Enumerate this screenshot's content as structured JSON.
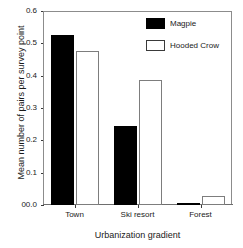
{
  "chart_data": {
    "type": "bar",
    "title": "",
    "xlabel": "Urbanization gradient",
    "ylabel": "Mean number of pairs per survey point",
    "categories": [
      "Town",
      "Ski resort",
      "Forest"
    ],
    "series": [
      {
        "name": "Magpie",
        "values": [
          0.525,
          0.245,
          0.005
        ],
        "color": "#000000",
        "style": "filled"
      },
      {
        "name": "Hooded Crow",
        "values": [
          0.475,
          0.388,
          0.028
        ],
        "color": "#ffffff",
        "style": "hollow"
      }
    ],
    "ylim": [
      0.0,
      0.6
    ],
    "yticks": [
      0.0,
      0.1,
      0.2,
      0.3,
      0.4,
      0.5,
      0.6
    ],
    "ytick_labels": [
      "00.0",
      "0.1",
      "0.2",
      "0.3",
      "0.4",
      "0.5",
      "0.6"
    ],
    "grid": false,
    "legend_position": "top-right",
    "frame": true
  },
  "legend": {
    "items": [
      {
        "label": "Magpie",
        "style": "filled"
      },
      {
        "label": "Hooded Crow",
        "style": "hollow"
      }
    ]
  }
}
